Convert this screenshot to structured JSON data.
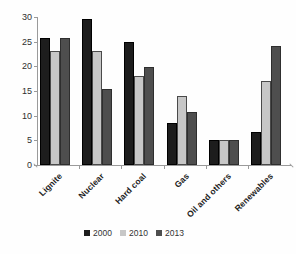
{
  "chart_data": {
    "type": "bar",
    "title": "",
    "xlabel": "",
    "ylabel": "",
    "categories": [
      "Lignite",
      "Nuclear",
      "Hard coal",
      "Gas",
      "Oil and others",
      "Renewables"
    ],
    "series": [
      {
        "name": "2000",
        "color": "#1d1d1d",
        "edge": "#000000",
        "values": [
          25.7,
          29.5,
          24.9,
          8.6,
          5.1,
          6.7
        ]
      },
      {
        "name": "2010",
        "color": "#c7c7c7",
        "edge": "#4a4a4a",
        "values": [
          23.1,
          23.2,
          18.1,
          14.0,
          5.0,
          17.0
        ]
      },
      {
        "name": "2013",
        "color": "#4e4e4e",
        "edge": "#2e2e2e",
        "values": [
          25.8,
          15.5,
          19.8,
          10.7,
          5.1,
          24.2
        ]
      }
    ],
    "ylim": [
      0,
      30
    ],
    "yticks": [
      0,
      5,
      10,
      15,
      20,
      25,
      30
    ],
    "grid": false,
    "legend_position": "bottom",
    "axis_color": "#9a9a9a",
    "text_color": "#2e2e2e"
  }
}
